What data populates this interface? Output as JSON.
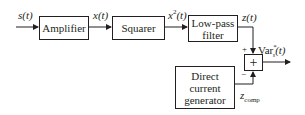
{
  "blocks": {
    "amplifier": "Amplifier",
    "squarer": "Squarer",
    "lowpass_line1": "Low-pass",
    "lowpass_line2": "filter",
    "dc_line1": "Direct",
    "dc_line2": "current",
    "dc_line3": "generator",
    "summer": "+"
  },
  "signals": {
    "input": "s(t)",
    "amp_out": "x(t)",
    "sq_out_base": "x",
    "sq_out_sup": "2",
    "sq_out_tail": "(t)",
    "lpf_out": "z(t)",
    "output_base": "Var",
    "output_sup": "*",
    "output_sub": "s",
    "output_tail": "(t)",
    "comp_base": "z",
    "comp_sub": "comp",
    "plus_sign": "+",
    "minus_sign": "−"
  }
}
